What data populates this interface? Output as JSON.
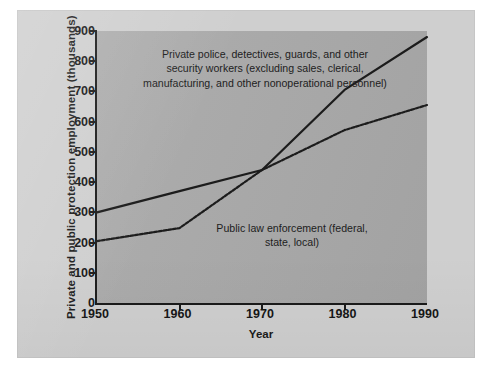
{
  "figure": {
    "ylabel": "Private and public protection employment (thousands)",
    "xlabel": "Year",
    "annotations": {
      "private": "Private police, detectives, guards, and other security workers (excluding sales, clerical, manufacturing, and other nonoperational personnel)",
      "public": "Public law enforcement (federal, state, local)"
    }
  },
  "colors": {
    "page_background": "#ffffff",
    "panel_background": "#cfcfcf",
    "plot_background": "#a9a9a9",
    "axis": "#1a1a1a",
    "line": "#1c1c1c",
    "text": "#161616"
  },
  "chart_data": {
    "type": "line",
    "title": "",
    "xlabel": "Year",
    "ylabel": "Private and public protection employment (thousands)",
    "x": [
      1950,
      1960,
      1970,
      1980,
      1990
    ],
    "xlim": [
      1950,
      1990
    ],
    "ylim": [
      0,
      900
    ],
    "xticks": [
      1950,
      1960,
      1970,
      1980,
      1990
    ],
    "yticks": [
      0,
      100,
      200,
      300,
      400,
      500,
      600,
      700,
      800,
      900
    ],
    "grid": false,
    "legend": "none (series labeled by in-plot annotations)",
    "series": [
      {
        "name": "Private police, detectives, guards, and other security workers (excluding sales, clerical, manufacturing, and other nonoperational personnel)",
        "style": "solid",
        "values": [
          300,
          370,
          440,
          705,
          880
        ]
      },
      {
        "name": "Public law enforcement (federal, state, local)",
        "style": "dotted",
        "values": [
          205,
          248,
          440,
          572,
          655
        ]
      }
    ],
    "annotations": [
      {
        "text": "Private police, detectives, guards, and other security workers (excluding sales, clerical, manufacturing, and other nonoperational personnel)",
        "series": 0
      },
      {
        "text": "Public law enforcement (federal, state, local)",
        "series": 1
      }
    ]
  }
}
